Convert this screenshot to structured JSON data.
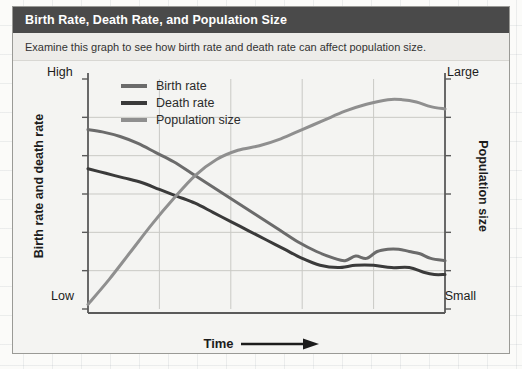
{
  "card": {
    "title": "Birth Rate, Death Rate, and Population Size",
    "subtitle": "Examine this graph to see how birth rate and death rate can affect population size.",
    "title_bar_color": "#4a4a4a",
    "title_text_color": "#ffffff",
    "background_color": "#f4f4f2",
    "border_color": "#9a9a96"
  },
  "chart_data": {
    "type": "line",
    "title": "Birth Rate, Death Rate, and Population Size",
    "subtitle": "Examine this graph to see how birth rate and death rate can affect population size.",
    "xlabel": "Time",
    "xlabel_arrow": "⟶",
    "ylabel": "Birth rate and death rate",
    "ylabel_right": "Population size",
    "x_tick_labels": [],
    "y_left_tick_labels": [
      "Low",
      "High"
    ],
    "y_right_tick_labels": [
      "Small",
      "Large"
    ],
    "ylim": [
      0,
      100
    ],
    "xlim": [
      0,
      100
    ],
    "grid": true,
    "grid_color": "#c9c9c5",
    "n_gridlines_x": 5,
    "n_gridlines_y": 6,
    "legend_position": "top-left",
    "axis_color": "#5a5a5a",
    "series": [
      {
        "name": "Birth rate",
        "color": "#6b6b6b",
        "axis": "left",
        "values": [
          [
            0,
            78
          ],
          [
            4,
            77
          ],
          [
            9,
            75
          ],
          [
            14,
            72
          ],
          [
            19,
            68
          ],
          [
            24,
            64
          ],
          [
            29,
            59
          ],
          [
            34,
            54
          ],
          [
            39,
            49
          ],
          [
            44,
            44
          ],
          [
            49,
            39
          ],
          [
            54,
            34
          ],
          [
            59,
            29
          ],
          [
            64,
            25
          ],
          [
            69,
            22
          ],
          [
            72,
            21
          ],
          [
            75,
            23
          ],
          [
            78,
            22
          ],
          [
            81,
            25
          ],
          [
            84,
            26
          ],
          [
            87,
            26
          ],
          [
            90,
            25
          ],
          [
            93,
            24
          ],
          [
            96,
            22
          ],
          [
            100,
            21
          ]
        ]
      },
      {
        "name": "Death rate",
        "color": "#3a3a3a",
        "axis": "left",
        "values": [
          [
            0,
            61
          ],
          [
            5,
            59
          ],
          [
            10,
            57
          ],
          [
            15,
            55
          ],
          [
            20,
            52
          ],
          [
            25,
            49
          ],
          [
            30,
            46
          ],
          [
            35,
            42
          ],
          [
            40,
            38
          ],
          [
            45,
            34
          ],
          [
            50,
            30
          ],
          [
            55,
            26
          ],
          [
            60,
            22
          ],
          [
            65,
            19
          ],
          [
            70,
            18
          ],
          [
            75,
            19
          ],
          [
            80,
            19
          ],
          [
            85,
            18
          ],
          [
            90,
            18
          ],
          [
            94,
            16
          ],
          [
            97,
            15
          ],
          [
            100,
            15
          ]
        ]
      },
      {
        "name": "Population size",
        "color": "#8f8f8f",
        "axis": "right",
        "values": [
          [
            0,
            2
          ],
          [
            6,
            13
          ],
          [
            12,
            25
          ],
          [
            18,
            37
          ],
          [
            24,
            48
          ],
          [
            30,
            58
          ],
          [
            36,
            65
          ],
          [
            42,
            69
          ],
          [
            48,
            71
          ],
          [
            54,
            74
          ],
          [
            60,
            78
          ],
          [
            66,
            82
          ],
          [
            72,
            86
          ],
          [
            78,
            89
          ],
          [
            84,
            91
          ],
          [
            88,
            91
          ],
          [
            92,
            90
          ],
          [
            96,
            88
          ],
          [
            100,
            87
          ]
        ]
      }
    ]
  },
  "legend": {
    "items": [
      {
        "label": "Birth rate",
        "color": "#6b6b6b"
      },
      {
        "label": "Death rate",
        "color": "#3a3a3a"
      },
      {
        "label": "Population size",
        "color": "#8f8f8f"
      }
    ]
  }
}
